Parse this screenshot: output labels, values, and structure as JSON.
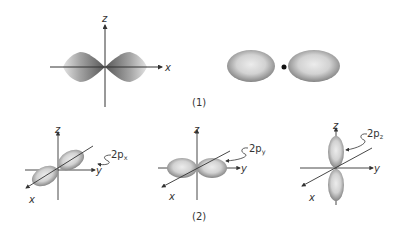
{
  "figure_1": {
    "caption": "(1)",
    "left_plot": {
      "axis_labels": {
        "vertical": "z",
        "horizontal": "x"
      },
      "shape": "dumbbell-shaded-lobes-along-x"
    },
    "right_plot": {
      "shape": "two-ellipsoid-lobes-with-nucleus-dot"
    }
  },
  "figure_2": {
    "caption": "(2)",
    "orbitals": [
      {
        "name": "2p",
        "subscript": "x",
        "axis_labels": {
          "z": "z",
          "y": "y",
          "x": "x"
        }
      },
      {
        "name": "2p",
        "subscript": "y",
        "axis_labels": {
          "z": "z",
          "y": "y",
          "x": "x"
        }
      },
      {
        "name": "2p",
        "subscript": "z",
        "axis_labels": {
          "z": "z",
          "y": "y",
          "x": "x"
        }
      }
    ]
  },
  "colors": {
    "axis": "#333333",
    "lobe_light": "#e6e6e6",
    "lobe_dark": "#8a8a8a",
    "background": "#ffffff"
  }
}
